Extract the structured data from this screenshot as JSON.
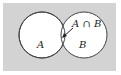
{
  "diagram": {
    "type": "venn",
    "background_color": "#d3d3d3",
    "circle_fill": "#ffffff",
    "stroke_color": "#444444",
    "sets": [
      {
        "label": "A"
      },
      {
        "label": "B"
      }
    ],
    "intersection_label": "A ∩ B"
  }
}
